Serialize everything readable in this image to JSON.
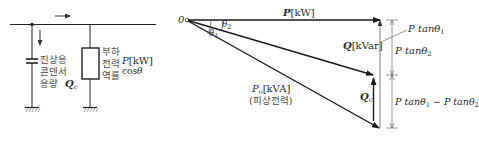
{
  "circuit": {
    "capacitor_label_lines": [
      "진상용",
      "콘덴서",
      "용량"
    ],
    "capacitor_symbol": "Q",
    "capacitor_symbol_sub": "c",
    "load_label_lines": [
      "부하",
      "전력",
      "역률"
    ],
    "load_power_symbol": "P",
    "load_power_unit": "[kW]",
    "load_pf": "cos",
    "load_pf_theta": "θ"
  },
  "phasor": {
    "origin": "0",
    "real_power_symbol": "P",
    "real_power_unit": "[kW]",
    "theta1": "θ",
    "theta1_sub": "1",
    "theta2": "θ",
    "theta2_sub": "2",
    "reactive_symbol": "Q",
    "reactive_unit": "[kVar]",
    "apparent_symbol": "P",
    "apparent_sub": "o",
    "apparent_unit": "[kVA]",
    "apparent_note": "(피상전력)",
    "qc_symbol": "Q",
    "qc_sub": "c",
    "ptan1": "P tanθ",
    "ptan1_sub": "1",
    "ptan2": "P tanθ",
    "ptan2_sub": "2",
    "diff_a": "P tanθ",
    "diff_a_sub": "1",
    "diff_minus": " − ",
    "diff_b": "P tanθ",
    "diff_b_sub": "2"
  },
  "colors": {
    "line": "#1a1a1a",
    "thin_line": "#555555",
    "text": "#3a3a3a"
  }
}
